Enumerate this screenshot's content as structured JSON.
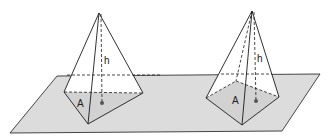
{
  "figure": {
    "colors": {
      "plane": "#d9d9d9",
      "line": "#1a1a1a",
      "base_fill": "#cfcfcf"
    },
    "pyramids": [
      {
        "id": "triangular",
        "base_label": "A",
        "height_label": "h"
      },
      {
        "id": "square",
        "base_label": "A",
        "height_label": "h"
      }
    ]
  }
}
